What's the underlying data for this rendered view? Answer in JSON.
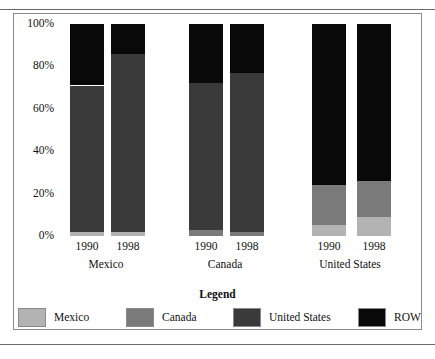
{
  "chart_data": {
    "type": "bar",
    "subtype": "stacked-100-percent",
    "title": "",
    "xlabel": "",
    "ylabel": "",
    "ylim": [
      0,
      100
    ],
    "yticks": [
      "0%",
      "20%",
      "40%",
      "60%",
      "80%",
      "100%"
    ],
    "ytick_values": [
      0,
      20,
      40,
      60,
      80,
      100
    ],
    "grid": false,
    "legend_title": "Legend",
    "legend_position": "bottom",
    "groups": [
      {
        "name": "Mexico",
        "bars": [
          "1990",
          "1998"
        ]
      },
      {
        "name": "Canada",
        "bars": [
          "1990",
          "1998"
        ]
      },
      {
        "name": "United States",
        "bars": [
          "1990",
          "1998"
        ]
      }
    ],
    "categories": [
      "Mexico 1990",
      "Mexico 1998",
      "Canada 1990",
      "Canada 1998",
      "United States 1990",
      "United States 1998"
    ],
    "series": [
      {
        "name": "Mexico",
        "color": "#b3b3b3",
        "values": [
          2,
          2,
          0,
          0,
          5,
          9
        ]
      },
      {
        "name": "Canada",
        "color": "#7a7a7a",
        "values": [
          0,
          0,
          3,
          2,
          19,
          17
        ]
      },
      {
        "name": "United States",
        "color": "#3a3a3a",
        "values": [
          69,
          84,
          69,
          75,
          0,
          0
        ]
      },
      {
        "name": "ROW",
        "color": "#090909",
        "values": [
          29,
          14,
          28,
          23,
          76,
          74
        ]
      }
    ],
    "bars_detail": [
      {
        "group": "Mexico",
        "year": "1990",
        "segments": [
          {
            "series": "Mexico",
            "value": 2,
            "color": "#b3b3b3"
          },
          {
            "series": "United States",
            "value": 69,
            "color": "#3a3a3a"
          },
          {
            "series": "ROW",
            "value": 29,
            "color": "#090909"
          }
        ]
      },
      {
        "group": "Mexico",
        "year": "1998",
        "segments": [
          {
            "series": "Mexico",
            "value": 2,
            "color": "#b3b3b3"
          },
          {
            "series": "United States",
            "value": 84,
            "color": "#3a3a3a"
          },
          {
            "series": "ROW",
            "value": 14,
            "color": "#090909"
          }
        ]
      },
      {
        "group": "Canada",
        "year": "1990",
        "segments": [
          {
            "series": "Canada",
            "value": 3,
            "color": "#7a7a7a"
          },
          {
            "series": "United States",
            "value": 69,
            "color": "#3a3a3a"
          },
          {
            "series": "ROW",
            "value": 28,
            "color": "#090909"
          }
        ]
      },
      {
        "group": "Canada",
        "year": "1998",
        "segments": [
          {
            "series": "Canada",
            "value": 2,
            "color": "#7a7a7a"
          },
          {
            "series": "United States",
            "value": 75,
            "color": "#3a3a3a"
          },
          {
            "series": "ROW",
            "value": 23,
            "color": "#090909"
          }
        ]
      },
      {
        "group": "United States",
        "year": "1990",
        "segments": [
          {
            "series": "Mexico",
            "value": 5,
            "color": "#b3b3b3"
          },
          {
            "series": "Canada",
            "value": 19,
            "color": "#7a7a7a"
          },
          {
            "series": "ROW",
            "value": 76,
            "color": "#090909"
          }
        ]
      },
      {
        "group": "United States",
        "year": "1998",
        "segments": [
          {
            "series": "Mexico",
            "value": 9,
            "color": "#b3b3b3"
          },
          {
            "series": "Canada",
            "value": 17,
            "color": "#7a7a7a"
          },
          {
            "series": "ROW",
            "value": 74,
            "color": "#090909"
          }
        ]
      }
    ]
  },
  "axis": {
    "y": {
      "t100": "100%",
      "t80": "80%",
      "t60": "60%",
      "t40": "40%",
      "t20": "20%",
      "t0": "0%"
    },
    "x": {
      "mexico_1990": "1990",
      "mexico_1998": "1998",
      "canada_1990": "1990",
      "canada_1998": "1998",
      "usa_1990": "1990",
      "usa_1998": "1998",
      "group_mexico": "Mexico",
      "group_canada": "Canada",
      "group_usa": "United States"
    }
  },
  "legend": {
    "title": "Legend",
    "items": [
      {
        "label": "Mexico",
        "color": "#b3b3b3"
      },
      {
        "label": "Canada",
        "color": "#7a7a7a"
      },
      {
        "label": "United States",
        "color": "#3a3a3a"
      },
      {
        "label": "ROW",
        "color": "#090909"
      }
    ]
  }
}
